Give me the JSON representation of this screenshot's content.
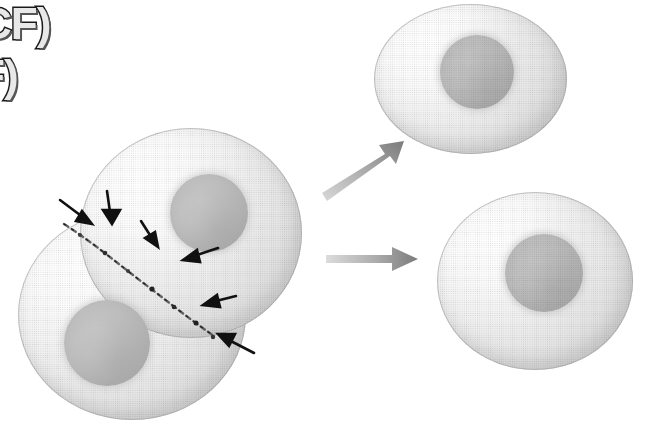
{
  "figure": {
    "background_color": "#ffffff",
    "width": 645,
    "height": 429
  },
  "caption": {
    "line1": "CF)",
    "line2": "F)",
    "note": "partially cropped bold outlined label text at upper-left edge"
  },
  "colors": {
    "cytoplasm_light": "#ffffff",
    "cytoplasm_mid": "#e6e6e6",
    "cytoplasm_edge": "#d2d2d2",
    "nucleus": "#b3b3b3",
    "furrow_marker": "#1a1a1a",
    "transition_arrow": "#8c8c8c",
    "outline": "#a0a0a0"
  },
  "cells": {
    "dividing_pair": {
      "label": "dividing-cell-pair",
      "upper_cell": {
        "name": "parent-cell-upper",
        "nucleus": "nucleus-upper"
      },
      "lower_cell": {
        "name": "parent-cell-lower",
        "nucleus": "nucleus-lower"
      },
      "furrow": {
        "name": "cleavage-furrow",
        "style": "beaded dark dotted line",
        "orientation": "diagonal upper-left to lower-right"
      }
    },
    "daughter_top": {
      "label": "daughter-cell-top",
      "nucleus": "nucleus-daughter-top"
    },
    "daughter_bottom": {
      "label": "daughter-cell-bottom",
      "nucleus": "nucleus-daughter-bottom"
    }
  },
  "pointer_arrows": [
    {
      "id": "furrow-arrow-1",
      "x": 62,
      "y": 198,
      "angle": 35,
      "length": 32,
      "points_to": "cleavage furrow, left edge"
    },
    {
      "id": "furrow-arrow-2",
      "x": 105,
      "y": 192,
      "angle": 80,
      "length": 30,
      "points_to": "cleavage furrow, upper notch"
    },
    {
      "id": "furrow-arrow-3",
      "x": 143,
      "y": 219,
      "angle": 58,
      "length": 30,
      "points_to": "cleavage furrow, upper middle"
    },
    {
      "id": "furrow-arrow-4",
      "x": 214,
      "y": 255,
      "angle": 195,
      "length": 34,
      "points_to": "cleavage furrow, lower middle"
    },
    {
      "id": "furrow-arrow-5",
      "x": 231,
      "y": 297,
      "angle": 190,
      "length": 32,
      "points_to": "cleavage furrow, lower notch"
    },
    {
      "id": "furrow-arrow-6",
      "x": 248,
      "y": 340,
      "angle": 208,
      "length": 36,
      "points_to": "cleavage furrow, right edge"
    }
  ],
  "transition_arrows": [
    {
      "id": "transition-arrow-upper",
      "from_x": 322,
      "from_y": 192,
      "to_x": 398,
      "to_y": 145,
      "direction": "up-right",
      "meaning": "separation into upper daughter cell"
    },
    {
      "id": "transition-arrow-lower",
      "from_x": 326,
      "from_y": 259,
      "to_x": 416,
      "to_y": 259,
      "direction": "right",
      "meaning": "separation into lower daughter cell"
    }
  ]
}
